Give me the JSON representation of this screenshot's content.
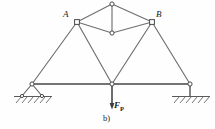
{
  "figure": {
    "caption": "b)",
    "type": "truss-structure-diagram",
    "labels": {
      "joint_a": "A",
      "joint_b": "B",
      "load_symbol": "F",
      "load_subscript": "P"
    },
    "colors": {
      "member_stroke": "#6f6f6f",
      "dark_stroke": "#4a4a4a",
      "node_fill": "#ffffff",
      "text": "#1a1a1a",
      "background": "#fefefe"
    },
    "geometry": {
      "nodes": [
        {
          "id": "apex",
          "name": "top-apex-node",
          "x": 112,
          "y": 4,
          "shape": "circle"
        },
        {
          "id": "a",
          "name": "joint-a-node",
          "x": 77,
          "y": 22,
          "shape": "square"
        },
        {
          "id": "b",
          "name": "joint-b-node",
          "x": 152,
          "y": 22,
          "shape": "square"
        },
        {
          "id": "mid",
          "name": "diamond-lower-node",
          "x": 112,
          "y": 33,
          "shape": "circle"
        },
        {
          "id": "left",
          "name": "left-support-node",
          "x": 32,
          "y": 84,
          "shape": "circle"
        },
        {
          "id": "center",
          "name": "center-load-node",
          "x": 112,
          "y": 84,
          "shape": "circle"
        },
        {
          "id": "right",
          "name": "right-support-node",
          "x": 190,
          "y": 84,
          "shape": "circle"
        }
      ],
      "members": [
        {
          "name": "member-apex-a",
          "from": "apex",
          "to": "a"
        },
        {
          "name": "member-apex-b",
          "from": "apex",
          "to": "b"
        },
        {
          "name": "member-apex-mid",
          "from": "apex",
          "to": "mid"
        },
        {
          "name": "member-a-mid",
          "from": "a",
          "to": "mid"
        },
        {
          "name": "member-b-mid",
          "from": "b",
          "to": "mid"
        },
        {
          "name": "member-a-left",
          "from": "a",
          "to": "left"
        },
        {
          "name": "member-a-center",
          "from": "a",
          "to": "center"
        },
        {
          "name": "member-b-center",
          "from": "b",
          "to": "center"
        },
        {
          "name": "member-b-right",
          "from": "b",
          "to": "right"
        },
        {
          "name": "member-bottom-chord",
          "from": "left",
          "to": "right"
        }
      ],
      "supports": [
        {
          "name": "left-pin-support",
          "kind": "pin",
          "x": 32,
          "y": 84,
          "ground_y": 97
        },
        {
          "name": "right-pin-support",
          "kind": "fixed",
          "x": 190,
          "y": 84,
          "ground_y": 96
        }
      ],
      "load": {
        "name": "downward-point-load",
        "x": 112,
        "from_y": 84,
        "to_y": 108,
        "direction": "down"
      }
    }
  }
}
